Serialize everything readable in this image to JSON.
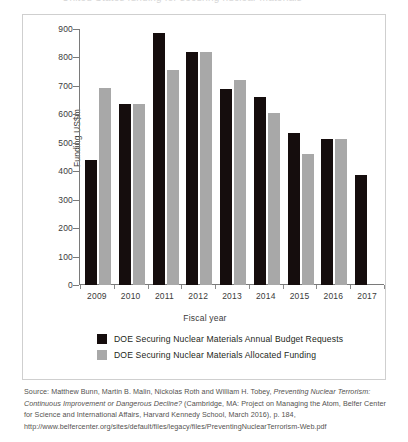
{
  "top_crop_text": "United States funding for securing nuclear materials",
  "chart_data": {
    "type": "bar",
    "title": "",
    "xlabel": "Fiscal year",
    "ylabel": "Funding US$m",
    "categories": [
      "2009",
      "2010",
      "2011",
      "2012",
      "2013",
      "2014",
      "2015",
      "2016",
      "2017"
    ],
    "ylim": [
      0,
      900
    ],
    "yticks": [
      0,
      100,
      200,
      300,
      400,
      500,
      600,
      700,
      800,
      900
    ],
    "ytick_labels": [
      "0",
      "100",
      "200",
      "300",
      "400",
      "500",
      "600",
      "700",
      "800",
      "900"
    ],
    "grid": false,
    "legend_position": "below-plot",
    "series": [
      {
        "name": "DOE Securing Nuclear Materials Annual Budget Requests",
        "color": "#150d0d",
        "values": [
          440,
          637,
          885,
          820,
          690,
          660,
          533,
          512,
          387
        ]
      },
      {
        "name": "DOE Securing Nuclear Materials Allocated Funding",
        "color": "#a8a8a8",
        "values": [
          693,
          635,
          757,
          820,
          722,
          603,
          460,
          512,
          null
        ]
      }
    ]
  },
  "legend": [
    {
      "label": "DOE Securing Nuclear Materials Annual Budget Requests",
      "swatch": "req"
    },
    {
      "label": "DOE Securing Nuclear Materials Allocated Funding",
      "swatch": "alloc"
    }
  ],
  "source": {
    "text": "Source: Matthew Bunn, Martin B. Malin, Nickolas Roth and William H. Tobey, Preventing Nuclear Terrorism: Continuous Improvement or Dangerous Decline? (Cambridge, MA: Project on Managing the Atom, Belfer Center for Science and International Affairs, Harvard Kennedy School, March 2016), p. 184, http://www.belfercenter.org/sites/default/files/legacy/files/PreventingNuclearTerrorism-Web.pdf"
  }
}
